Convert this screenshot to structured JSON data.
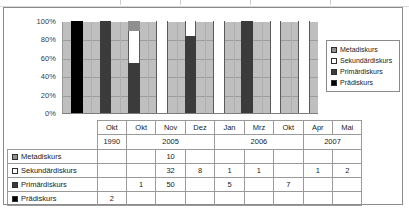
{
  "chart_data": {
    "type": "bar",
    "subtype": "100% stacked column",
    "title": "",
    "xlabel": "",
    "ylabel": "",
    "ylim": [
      0,
      100
    ],
    "ytick_labels": [
      "100%",
      "80%",
      "60%",
      "40%",
      "20%",
      "0%"
    ],
    "ytick_values": [
      100,
      80,
      60,
      40,
      20,
      0
    ],
    "grid": true,
    "legend_position": "right",
    "categories": [
      "Okt",
      "Okt",
      "Nov",
      "Dez",
      "Jan",
      "Mrz",
      "Okt",
      "Apr",
      "Mai"
    ],
    "category_years": [
      "1990",
      "2005",
      "2005",
      "2005",
      "2006",
      "2006",
      "2006",
      "2007",
      "2007"
    ],
    "year_groups": [
      {
        "label": "1990",
        "span": 1
      },
      {
        "label": "2005",
        "span": 3
      },
      {
        "label": "2006",
        "span": 3
      },
      {
        "label": "2007",
        "span": 2
      }
    ],
    "series": [
      {
        "name": "Metadiskurs",
        "color": "#8f8f8f",
        "values": [
          0,
          0,
          10,
          0,
          0,
          0,
          0,
          0,
          0
        ]
      },
      {
        "name": "Sekundärdiskurs",
        "color": "#ffffff",
        "values": [
          0,
          0,
          32,
          8,
          1,
          1,
          0,
          1,
          2
        ]
      },
      {
        "name": "Primärdiskurs",
        "color": "#3b3b3b",
        "values": [
          0,
          1,
          50,
          0,
          5,
          0,
          7,
          0,
          0
        ]
      },
      {
        "name": "Prädiskurs",
        "color": "#000000",
        "values": [
          2,
          0,
          0,
          0,
          0,
          0,
          0,
          0,
          0
        ]
      }
    ],
    "stack_order_bottom_to_top": [
      "Prädiskurs",
      "Primärdiskurs",
      "Sekundärdiskurs",
      "Metadiskurs"
    ],
    "percent_series": [
      {
        "name": "Metadiskurs",
        "values": [
          0,
          0,
          10.87,
          0,
          0,
          0,
          0,
          0,
          0
        ]
      },
      {
        "name": "Sekundärdiskurs",
        "values": [
          0,
          0,
          34.78,
          100,
          16.67,
          100,
          0,
          100,
          100
        ]
      },
      {
        "name": "Primärdiskurs",
        "values": [
          0,
          100,
          54.35,
          0,
          83.33,
          0,
          100,
          0,
          0
        ]
      },
      {
        "name": "Prädiskurs",
        "values": [
          100,
          0,
          0,
          0,
          0,
          0,
          0,
          0,
          0
        ]
      }
    ]
  },
  "legend": {
    "items": [
      {
        "label": "Metadiskurs",
        "swatch": "meta"
      },
      {
        "label": "Sekundärdiskurs",
        "swatch": "sek"
      },
      {
        "label": "Primärdiskurs",
        "swatch": "prim"
      },
      {
        "label": "Prädiskurs",
        "swatch": "prae"
      }
    ]
  },
  "table": {
    "row_labels": [
      "Metadiskurs",
      "Sekundärdiskurs",
      "Primärdiskurs",
      "Prädiskurs"
    ],
    "rows": [
      {
        "label": "Metadiskurs",
        "cells": [
          "",
          "",
          "10",
          "",
          "",
          "",
          "",
          "",
          ""
        ]
      },
      {
        "label": "Sekundärdiskurs",
        "cells": [
          "",
          "",
          "32",
          "8",
          "1",
          "1",
          "",
          "1",
          "2"
        ]
      },
      {
        "label": "Primärdiskurs",
        "cells": [
          "",
          "1",
          "50",
          "",
          "5",
          "",
          "7",
          "",
          ""
        ]
      },
      {
        "label": "Prädiskurs",
        "cells": [
          "2",
          "",
          "",
          "",
          "",
          "",
          "",
          "",
          ""
        ]
      }
    ]
  }
}
